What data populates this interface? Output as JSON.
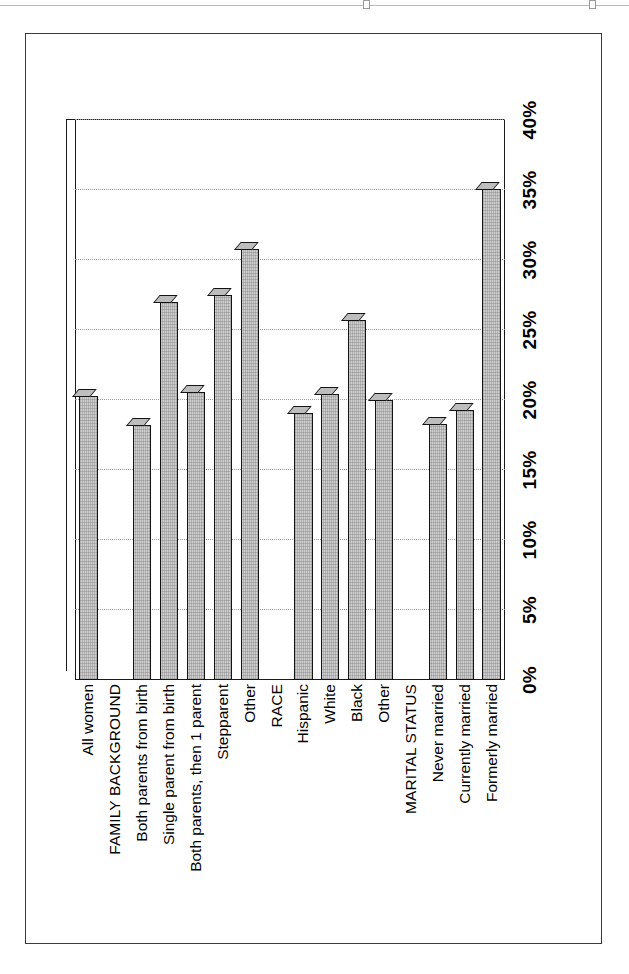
{
  "document": {
    "page_frame": "bordered-scan-page",
    "orientation": "landscape-chart-on-portrait-page"
  },
  "chart_data": {
    "type": "bar",
    "orientation": "horizontal",
    "title": "",
    "subtitle": "",
    "xlabel": "",
    "ylabel": "",
    "xlim": [
      0,
      40
    ],
    "grid": true,
    "legend": false,
    "value_suffix": "%",
    "axis_ticks": [
      "0%",
      "5%",
      "10%",
      "15%",
      "20%",
      "25%",
      "30%",
      "35%",
      "40%"
    ],
    "axis_tick_values": [
      0,
      5,
      10,
      15,
      20,
      25,
      30,
      35,
      40
    ],
    "categories": [
      "All women",
      "FAMILY BACKGROUND",
      "Both parents from birth",
      "Single parent from birth",
      "Both parents, then 1 parent",
      "Stepparent",
      "Other",
      "RACE",
      "Hispanic",
      "White",
      "Black",
      "Other",
      "MARITAL STATUS",
      "Never married",
      "Currently married",
      "Formerly married"
    ],
    "group_headers": [
      "FAMILY BACKGROUND",
      "RACE",
      "MARITAL STATUS"
    ],
    "values": [
      20.3,
      null,
      18.2,
      27.0,
      20.6,
      27.5,
      30.8,
      null,
      19.1,
      20.4,
      25.7,
      20.0,
      null,
      18.3,
      19.3,
      35.1
    ],
    "bars": [
      {
        "label": "All women",
        "value": 20.3
      },
      {
        "label": "FAMILY BACKGROUND",
        "value": null
      },
      {
        "label": "Both parents from birth",
        "value": 18.2
      },
      {
        "label": "Single parent from birth",
        "value": 27.0
      },
      {
        "label": "Both parents, then 1 parent",
        "value": 20.6
      },
      {
        "label": "Stepparent",
        "value": 27.5
      },
      {
        "label": "Other",
        "value": 30.8
      },
      {
        "label": "RACE",
        "value": null
      },
      {
        "label": "Hispanic",
        "value": 19.1
      },
      {
        "label": "White",
        "value": 20.4
      },
      {
        "label": "Black",
        "value": 25.7
      },
      {
        "label": "Other",
        "value": 20.0
      },
      {
        "label": "MARITAL STATUS",
        "value": null
      },
      {
        "label": "Never married",
        "value": 18.3
      },
      {
        "label": "Currently married",
        "value": 19.3
      },
      {
        "label": "Formerly married",
        "value": 35.1
      }
    ],
    "colors": {
      "bar_fill": "#cfcfcf",
      "bar_edge": "#141414",
      "gridline": "#9d9d9d",
      "axis": "#1a1a1a",
      "background": "#ffffff"
    }
  }
}
